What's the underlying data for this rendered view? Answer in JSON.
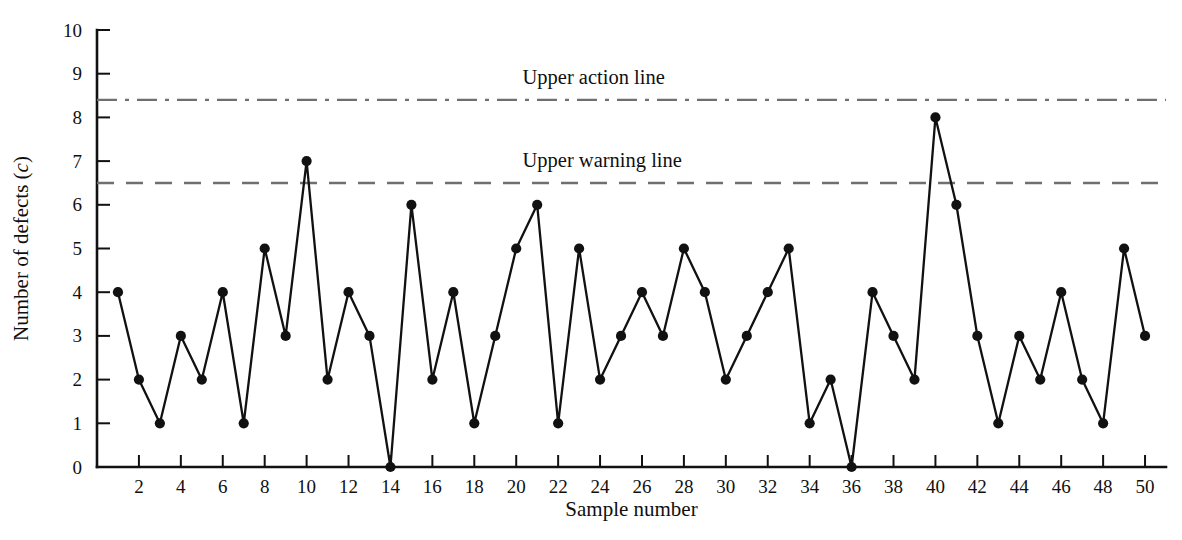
{
  "chart_data": {
    "type": "line",
    "title": "",
    "xlabel": "Sample number",
    "ylabel": "Number of defects (c)",
    "ylabel_main": "Number of defects (",
    "ylabel_var": "c",
    "ylabel_tail": ")",
    "xlim": [
      0,
      51
    ],
    "ylim": [
      0,
      10
    ],
    "grid": false,
    "legend": "none",
    "x": [
      1,
      2,
      3,
      4,
      5,
      6,
      7,
      8,
      9,
      10,
      11,
      12,
      13,
      14,
      15,
      16,
      17,
      18,
      19,
      20,
      21,
      22,
      23,
      24,
      25,
      26,
      27,
      28,
      29,
      30,
      31,
      32,
      33,
      34,
      35,
      36,
      37,
      38,
      39,
      40,
      41,
      42,
      43,
      44,
      45,
      46,
      47,
      48,
      49,
      50
    ],
    "values": [
      4,
      2,
      1,
      3,
      2,
      4,
      1,
      5,
      3,
      7,
      2,
      4,
      3,
      0,
      6,
      2,
      4,
      1,
      3,
      5,
      6,
      1,
      5,
      2,
      3,
      4,
      3,
      5,
      4,
      2,
      3,
      4,
      5,
      1,
      2,
      0,
      4,
      3,
      2,
      8,
      6,
      3,
      1,
      3,
      2,
      4,
      2,
      1,
      5,
      3
    ],
    "series": [
      {
        "name": "Number of defects (c)",
        "values": [
          4,
          2,
          1,
          3,
          2,
          4,
          1,
          5,
          3,
          7,
          2,
          4,
          3,
          0,
          6,
          2,
          4,
          1,
          3,
          5,
          6,
          1,
          5,
          2,
          3,
          4,
          3,
          5,
          4,
          2,
          3,
          4,
          5,
          1,
          2,
          0,
          4,
          3,
          2,
          8,
          6,
          3,
          1,
          3,
          2,
          4,
          2,
          1,
          5,
          3
        ],
        "marker": "filled-circle",
        "color": "#111111"
      }
    ],
    "y_ticks": [
      0,
      1,
      2,
      3,
      4,
      5,
      6,
      7,
      8,
      9,
      10
    ],
    "y_tick_labels": [
      "0",
      "1",
      "2",
      "3",
      "4",
      "5",
      "6",
      "7",
      "8",
      "9",
      "10"
    ],
    "x_ticks": [
      2,
      4,
      6,
      8,
      10,
      12,
      14,
      16,
      18,
      20,
      22,
      24,
      26,
      28,
      30,
      32,
      34,
      36,
      38,
      40,
      42,
      44,
      46,
      48,
      50
    ],
    "x_tick_labels": [
      "2",
      "4",
      "6",
      "8",
      "10",
      "12",
      "14",
      "16",
      "18",
      "20",
      "22",
      "24",
      "26",
      "28",
      "30",
      "32",
      "34",
      "36",
      "38",
      "40",
      "42",
      "44",
      "46",
      "48",
      "50"
    ],
    "reference_lines": [
      {
        "id": "upper-action-line",
        "label": "Upper action line",
        "value": 8.4,
        "style": "dash-dot",
        "color": "#6f6f6f",
        "label_x": 20.3
      },
      {
        "id": "upper-warning-line",
        "label": "Upper warning line",
        "value": 6.5,
        "style": "dashed",
        "color": "#6f6f6f",
        "label_x": 20.3
      }
    ]
  },
  "labels": {
    "x_axis_title": "Sample number",
    "y_axis_title": "Number of defects (c)",
    "upper_action_line": "Upper action line",
    "upper_warning_line": "Upper warning line"
  }
}
